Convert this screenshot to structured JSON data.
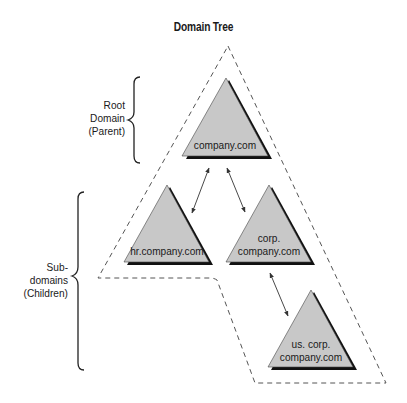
{
  "title": "Domain Tree",
  "side_labels": {
    "root": [
      "Root",
      "Domain",
      "(Parent)"
    ],
    "sub": [
      "Sub-",
      "domains",
      "(Children)"
    ]
  },
  "nodes": [
    {
      "id": "root",
      "lines": [
        "company.com"
      ]
    },
    {
      "id": "hr",
      "lines": [
        "hr.company.com"
      ]
    },
    {
      "id": "corp",
      "lines": [
        "corp.",
        "company.com"
      ]
    },
    {
      "id": "us-corp",
      "lines": [
        "us. corp.",
        "company.com"
      ]
    }
  ],
  "edges": [
    {
      "from": "root",
      "to": "hr"
    },
    {
      "from": "root",
      "to": "corp"
    },
    {
      "from": "corp",
      "to": "us-corp"
    }
  ],
  "colors": {
    "triangle_fill": "#c8c8c8",
    "triangle_shadow": "#111111",
    "dashed_outline": "#555555",
    "text": "#1a1a1a"
  }
}
